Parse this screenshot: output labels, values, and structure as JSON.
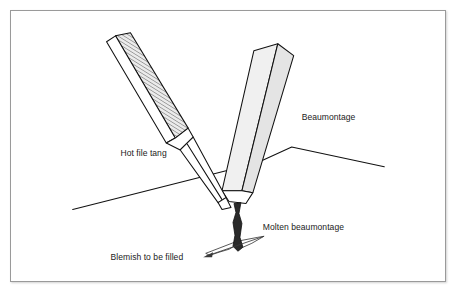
{
  "figure": {
    "border_color": "#9a9a9a",
    "background_color": "#ffffff",
    "ink_color": "#111111",
    "shade_light": "#f0f0f0",
    "shade_mid": "#e4e4e4",
    "molten_color": "#2a2a2a"
  },
  "labels": {
    "hot_file_tang": "Hot file tang",
    "beaumontage": "Beaumontage",
    "molten_beaumontage": "Molten beaumontage",
    "blemish_to_be_filled": "Blemish to be filled"
  },
  "diagram": {
    "type": "line-art technical illustration",
    "parts": [
      {
        "name": "hot-file-tang",
        "description": "crosshatched file blade angled from upper left down to the tip"
      },
      {
        "name": "beaumontage-stick",
        "description": "shaded stick angled from upper right down to the tip"
      },
      {
        "name": "molten-beaumontage-drip",
        "description": "dark molten strand falling from the converging tips"
      },
      {
        "name": "work-surface",
        "description": "ridged surface line crossing the scene"
      },
      {
        "name": "blemish",
        "description": "irregular lens-shaped depression on the surface to be filled"
      }
    ]
  }
}
